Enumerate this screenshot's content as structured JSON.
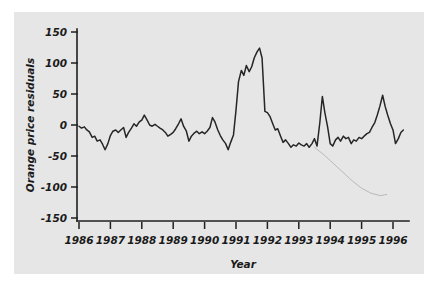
{
  "figure": {
    "background_color": "#e6e6e6",
    "page_color": "#ffffff",
    "line_color": "#262626",
    "faint_line_color": "#b9b9b9"
  },
  "chart_data": {
    "type": "line",
    "title": "",
    "subtitle": "",
    "xlabel": "Year",
    "ylabel": "Orange price residuals",
    "xlim": [
      1986,
      1996.4
    ],
    "ylim": [
      -150,
      150
    ],
    "grid": false,
    "legend": null,
    "x_ticks": [
      "1986",
      "1987",
      "1988",
      "1989",
      "1990",
      "1991",
      "1992",
      "1993",
      "1994",
      "1995",
      "1996"
    ],
    "x_tick_values": [
      1986,
      1987,
      1988,
      1989,
      1990,
      1991,
      1992,
      1993,
      1994,
      1995,
      1996
    ],
    "y_ticks": [
      "150",
      "100",
      "50",
      "0",
      "-50",
      "-100",
      "-150"
    ],
    "y_tick_values": [
      150,
      100,
      50,
      0,
      -50,
      -100,
      -150
    ],
    "series": [
      {
        "name": "Orange price residuals",
        "style": "solid-dark",
        "x": [
          1986.0,
          1986.08,
          1986.17,
          1986.25,
          1986.33,
          1986.42,
          1986.5,
          1986.58,
          1986.67,
          1986.75,
          1986.83,
          1986.92,
          1987.0,
          1987.08,
          1987.17,
          1987.25,
          1987.33,
          1987.42,
          1987.5,
          1987.58,
          1987.67,
          1987.75,
          1987.83,
          1987.92,
          1988.0,
          1988.08,
          1988.17,
          1988.25,
          1988.33,
          1988.42,
          1988.5,
          1988.58,
          1988.67,
          1988.75,
          1988.83,
          1988.92,
          1989.0,
          1989.08,
          1989.17,
          1989.25,
          1989.33,
          1989.42,
          1989.5,
          1989.58,
          1989.67,
          1989.75,
          1989.83,
          1989.92,
          1990.0,
          1990.08,
          1990.17,
          1990.25,
          1990.33,
          1990.42,
          1990.5,
          1990.58,
          1990.67,
          1990.75,
          1990.83,
          1990.92,
          1991.0,
          1991.08,
          1991.17,
          1991.25,
          1991.33,
          1991.42,
          1991.5,
          1991.58,
          1991.67,
          1991.75,
          1991.83,
          1991.92,
          1992.0,
          1992.08,
          1992.17,
          1992.25,
          1992.33,
          1992.42,
          1992.5,
          1992.58,
          1992.67,
          1992.75,
          1992.83,
          1992.92,
          1993.0,
          1993.08,
          1993.17,
          1993.25,
          1993.33,
          1993.42,
          1993.5,
          1993.58,
          1993.67,
          1993.75,
          1993.83,
          1993.92,
          1994.0,
          1994.08,
          1994.17,
          1994.25,
          1994.33,
          1994.42,
          1994.5,
          1994.58,
          1994.67,
          1994.75,
          1994.83,
          1994.92,
          1995.0,
          1995.08,
          1995.17,
          1995.25,
          1995.33,
          1995.42,
          1995.5,
          1995.58,
          1995.67,
          1995.75,
          1995.83,
          1995.92,
          1996.0,
          1996.08,
          1996.17,
          1996.25,
          1996.33
        ],
        "y": [
          -2,
          -5,
          -3,
          -8,
          -11,
          -20,
          -18,
          -26,
          -24,
          -31,
          -40,
          -30,
          -17,
          -10,
          -8,
          -12,
          -8,
          -4,
          -20,
          -12,
          -5,
          2,
          -2,
          5,
          8,
          16,
          8,
          0,
          -2,
          1,
          -2,
          -5,
          -8,
          -12,
          -18,
          -15,
          -12,
          -6,
          2,
          10,
          -2,
          -10,
          -26,
          -18,
          -13,
          -10,
          -14,
          -11,
          -14,
          -10,
          -4,
          12,
          5,
          -8,
          -17,
          -24,
          -30,
          -40,
          -28,
          -16,
          24,
          70,
          88,
          80,
          96,
          86,
          94,
          108,
          118,
          124,
          108,
          22,
          20,
          14,
          2,
          -8,
          -6,
          -18,
          -28,
          -24,
          -30,
          -36,
          -32,
          -34,
          -29,
          -32,
          -34,
          -30,
          -36,
          -30,
          -22,
          -34,
          4,
          46,
          20,
          -4,
          -30,
          -34,
          -24,
          -20,
          -26,
          -18,
          -22,
          -20,
          -30,
          -24,
          -26,
          -20,
          -22,
          -18,
          -14,
          -12,
          -4,
          4,
          16,
          30,
          48,
          30,
          16,
          2,
          -8,
          -30,
          -22,
          -12,
          -8
        ]
      },
      {
        "name": "smooth-trend",
        "style": "faint-gray",
        "x": [
          1993.5,
          1993.8,
          1994.1,
          1994.4,
          1994.7,
          1995.0,
          1995.3,
          1995.6,
          1995.8
        ],
        "y": [
          -36,
          -48,
          -62,
          -76,
          -90,
          -102,
          -110,
          -114,
          -112
        ]
      }
    ]
  }
}
